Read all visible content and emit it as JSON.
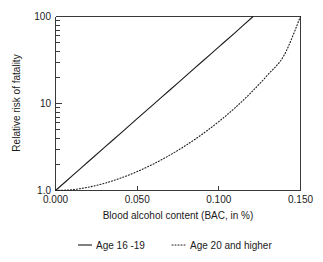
{
  "chart_data": {
    "type": "line",
    "title": "",
    "xlabel": "Blood alcohol content (BAC, in %)",
    "ylabel": "Relative risk of fatality",
    "xlim": [
      0.0,
      0.15
    ],
    "ylim": [
      1,
      100
    ],
    "yscale": "log",
    "xscale": "linear",
    "grid": false,
    "legend_position": "bottom",
    "xticks": [
      0.0,
      0.05,
      0.1,
      0.15
    ],
    "xtick_labels": [
      "0.000",
      "0.050",
      "0.100",
      "0.150"
    ],
    "yticks": [
      1,
      10,
      100
    ],
    "ytick_labels": [
      "1.0",
      "10",
      "100"
    ],
    "series": [
      {
        "name": "Age 16 -19",
        "style": "solid",
        "color": "#1a1a1a",
        "x": [
          0.0,
          0.01,
          0.02,
          0.03,
          0.04,
          0.05,
          0.06,
          0.07,
          0.08,
          0.09,
          0.1,
          0.11,
          0.121
        ],
        "values": [
          1.0,
          1.46,
          2.14,
          3.13,
          4.57,
          6.69,
          9.78,
          14.3,
          20.9,
          30.6,
          44.7,
          65.4,
          100.0
        ]
      },
      {
        "name": "Age 20 and higher",
        "style": "dotted",
        "color": "#1a1a1a",
        "x": [
          0.0,
          0.01,
          0.02,
          0.03,
          0.04,
          0.05,
          0.06,
          0.07,
          0.08,
          0.09,
          0.1,
          0.11,
          0.12,
          0.13,
          0.14,
          0.15
        ],
        "values": [
          1.0,
          1.02,
          1.09,
          1.21,
          1.39,
          1.65,
          2.02,
          2.55,
          3.32,
          4.46,
          6.2,
          8.95,
          13.5,
          21.4,
          36.0,
          100.0
        ]
      }
    ]
  },
  "axes": {
    "x_title": "Blood alcohol content (BAC, in %)",
    "y_title": "Relative risk of fatality",
    "x_tick_labels": [
      "0.000",
      "0.050",
      "0.100",
      "0.150"
    ],
    "y_tick_labels": [
      "100",
      "10",
      "1.0"
    ]
  },
  "legend": {
    "items": [
      {
        "label": "Age 16 -19",
        "style": "solid"
      },
      {
        "label": "Age 20 and higher",
        "style": "dotted"
      }
    ]
  }
}
